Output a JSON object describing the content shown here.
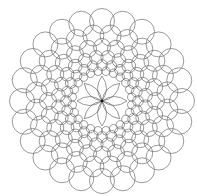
{
  "image": {
    "description": "Mandala coloring page: concentric rings of overlapping circles around a central eight-petal flower",
    "background": "#ffffff",
    "stroke_color": "#6f6f6f",
    "center": [
      102,
      101
    ],
    "outer_radius": 91
  },
  "rings": [
    {
      "count": 24,
      "radius_center": 80,
      "circle_r": 12.5,
      "offset": 0
    },
    {
      "count": 24,
      "radius_center": 66,
      "circle_r": 10.5,
      "offset": 0.5
    },
    {
      "count": 24,
      "radius_center": 54,
      "circle_r": 8.5,
      "offset": 0
    },
    {
      "count": 24,
      "radius_center": 44,
      "circle_r": 6.8,
      "offset": 0.5
    },
    {
      "count": 24,
      "radius_center": 36,
      "circle_r": 5.4,
      "offset": 0
    },
    {
      "count": 24,
      "radius_center": 30,
      "circle_r": 4.2,
      "offset": 0.5
    }
  ],
  "flower": {
    "petals": 8,
    "length": 25,
    "width": 9,
    "center_dot_r": 1.4
  }
}
